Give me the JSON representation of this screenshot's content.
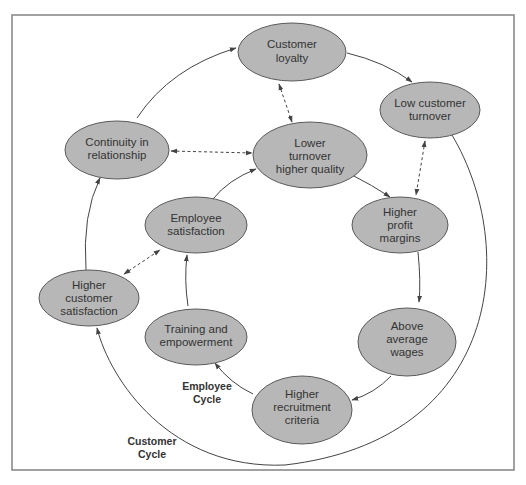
{
  "diagram": {
    "nodes": {
      "customer_loyalty": {
        "lines": [
          "Customer",
          "loyalty"
        ]
      },
      "low_customer_turnover": {
        "lines": [
          "Low customer",
          "turnover"
        ]
      },
      "continuity_in_relationship": {
        "lines": [
          "Continuity in",
          "relationship"
        ]
      },
      "lower_turnover_higher_quality": {
        "lines": [
          "Lower",
          "turnover",
          "higher quality"
        ]
      },
      "higher_profit_margins": {
        "lines": [
          "Higher",
          "profit",
          "margins"
        ]
      },
      "employee_satisfaction": {
        "lines": [
          "Employee",
          "satisfaction"
        ]
      },
      "higher_customer_satisfaction": {
        "lines": [
          "Higher",
          "customer",
          "satisfaction"
        ]
      },
      "training_and_empowerment": {
        "lines": [
          "Training and",
          "empowerment"
        ]
      },
      "above_average_wages": {
        "lines": [
          "Above",
          "average",
          "wages"
        ]
      },
      "higher_recruitment_criteria": {
        "lines": [
          "Higher",
          "recruitment",
          "criteria"
        ]
      }
    },
    "labels": {
      "employee_cycle": [
        "Employee",
        "Cycle"
      ],
      "customer_cycle": [
        "Customer",
        "Cycle"
      ]
    },
    "edges": {
      "solid": [
        [
          "continuity_in_relationship",
          "customer_loyalty"
        ],
        [
          "customer_loyalty",
          "low_customer_turnover"
        ],
        [
          "low_customer_turnover",
          "higher_customer_satisfaction"
        ],
        [
          "higher_customer_satisfaction",
          "continuity_in_relationship"
        ],
        [
          "employee_satisfaction",
          "lower_turnover_higher_quality"
        ],
        [
          "lower_turnover_higher_quality",
          "higher_profit_margins"
        ],
        [
          "higher_profit_margins",
          "above_average_wages"
        ],
        [
          "above_average_wages",
          "higher_recruitment_criteria"
        ],
        [
          "higher_recruitment_criteria",
          "training_and_empowerment"
        ],
        [
          "training_and_empowerment",
          "employee_satisfaction"
        ]
      ],
      "dashed_bidirectional": [
        [
          "customer_loyalty",
          "lower_turnover_higher_quality"
        ],
        [
          "continuity_in_relationship",
          "lower_turnover_higher_quality"
        ],
        [
          "low_customer_turnover",
          "higher_profit_margins"
        ],
        [
          "higher_customer_satisfaction",
          "employee_satisfaction"
        ]
      ]
    },
    "colors": {
      "node_fill": "#b7b7b7",
      "node_stroke": "#5a5a5a",
      "text": "#333333",
      "frame": "#8a8a8a"
    }
  }
}
